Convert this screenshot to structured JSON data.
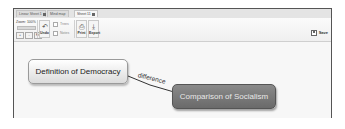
{
  "tabs": [
    {
      "label": "Linear Sheet 1",
      "active": false
    },
    {
      "label": "Mind map",
      "active": false
    },
    {
      "label": "Sheet 11",
      "active": true
    }
  ],
  "toolbar": {
    "zoom_label": "Zoom: 100%",
    "zoom_in_label": "+",
    "zoom_out_label": "-",
    "fit_label": "Fit",
    "undo_label": "Undo",
    "option1_label": "Trees",
    "option2_label": "Notes",
    "print_label": "Print",
    "export_label": "Export",
    "save_label": "Save"
  },
  "map": {
    "nodes": [
      {
        "label": "Definition of Democracy",
        "style": "light"
      },
      {
        "label": "Comparison of Socialism",
        "style": "dark"
      }
    ],
    "link_label": "difference"
  },
  "colors": {
    "node_light": "#eeeeee",
    "node_dark": "#777777",
    "link": "#333333"
  }
}
